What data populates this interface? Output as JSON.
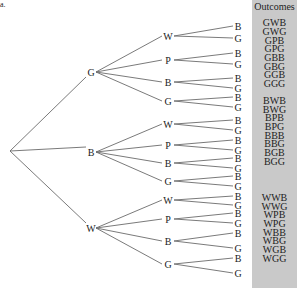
{
  "part_label": "a.",
  "outcomes_header": "Outcomes",
  "tree": {
    "root": {
      "x": 10,
      "y": 151
    },
    "first_level": [
      {
        "label": "G",
        "x": 91,
        "y": 72,
        "children": [
          {
            "label": "W",
            "x": 168,
            "y": 36,
            "leaves": [
              {
                "label": "B",
                "y": 26
              },
              {
                "label": "G",
                "y": 38
              }
            ]
          },
          {
            "label": "P",
            "x": 168,
            "y": 60,
            "leaves": [
              {
                "label": "B",
                "y": 53
              },
              {
                "label": "G",
                "y": 64
              }
            ]
          },
          {
            "label": "B",
            "x": 168,
            "y": 82,
            "leaves": [
              {
                "label": "B",
                "y": 78
              },
              {
                "label": "G",
                "y": 88
              }
            ]
          },
          {
            "label": "G",
            "x": 168,
            "y": 101,
            "leaves": [
              {
                "label": "B",
                "y": 97
              },
              {
                "label": "G",
                "y": 107
              }
            ]
          }
        ]
      },
      {
        "label": "B",
        "x": 91,
        "y": 152,
        "children": [
          {
            "label": "W",
            "x": 168,
            "y": 124,
            "leaves": [
              {
                "label": "B",
                "y": 120
              },
              {
                "label": "G",
                "y": 130
              }
            ]
          },
          {
            "label": "P",
            "x": 168,
            "y": 145,
            "leaves": [
              {
                "label": "B",
                "y": 140
              },
              {
                "label": "G",
                "y": 150
              }
            ]
          },
          {
            "label": "B",
            "x": 168,
            "y": 163,
            "leaves": [
              {
                "label": "B",
                "y": 158
              },
              {
                "label": "G",
                "y": 168
              }
            ]
          },
          {
            "label": "G",
            "x": 168,
            "y": 181,
            "leaves": [
              {
                "label": "B",
                "y": 176
              },
              {
                "label": "G",
                "y": 186
              }
            ]
          }
        ]
      },
      {
        "label": "W",
        "x": 91,
        "y": 228,
        "children": [
          {
            "label": "W",
            "x": 168,
            "y": 200,
            "leaves": [
              {
                "label": "B",
                "y": 196
              },
              {
                "label": "G",
                "y": 205
              }
            ]
          },
          {
            "label": "P",
            "x": 168,
            "y": 219,
            "leaves": [
              {
                "label": "B",
                "y": 213
              },
              {
                "label": "G",
                "y": 223
              }
            ]
          },
          {
            "label": "B",
            "x": 168,
            "y": 241,
            "leaves": [
              {
                "label": "B",
                "y": 233
              },
              {
                "label": "G",
                "y": 248
              }
            ]
          },
          {
            "label": "G",
            "x": 168,
            "y": 264,
            "leaves": [
              {
                "label": "B",
                "y": 258
              },
              {
                "label": "G",
                "y": 273
              }
            ]
          }
        ]
      }
    ],
    "leaf_x": 238
  },
  "outcomes": [
    {
      "label": "GWB",
      "y": 18
    },
    {
      "label": "GWG",
      "y": 27
    },
    {
      "label": "GPB",
      "y": 36
    },
    {
      "label": "GPG",
      "y": 44
    },
    {
      "label": "GBB",
      "y": 53
    },
    {
      "label": "GBG",
      "y": 62
    },
    {
      "label": "GGB",
      "y": 70
    },
    {
      "label": "GGG",
      "y": 79
    },
    {
      "label": "BWB",
      "y": 96
    },
    {
      "label": "BWG",
      "y": 105
    },
    {
      "label": "BPB",
      "y": 113
    },
    {
      "label": "BPG",
      "y": 122
    },
    {
      "label": "BBB",
      "y": 131
    },
    {
      "label": "BBG",
      "y": 139
    },
    {
      "label": "BGB",
      "y": 148
    },
    {
      "label": "BGG",
      "y": 157
    },
    {
      "label": "WWB",
      "y": 193
    },
    {
      "label": "WWG",
      "y": 202
    },
    {
      "label": "WPB",
      "y": 210
    },
    {
      "label": "WPG",
      "y": 219
    },
    {
      "label": "WBB",
      "y": 228
    },
    {
      "label": "WBG",
      "y": 236
    },
    {
      "label": "WGB",
      "y": 245
    },
    {
      "label": "WGG",
      "y": 254
    }
  ],
  "colors": {
    "panel": "#c9c9c9",
    "line": "#6b6b6b",
    "text": "#222222"
  }
}
